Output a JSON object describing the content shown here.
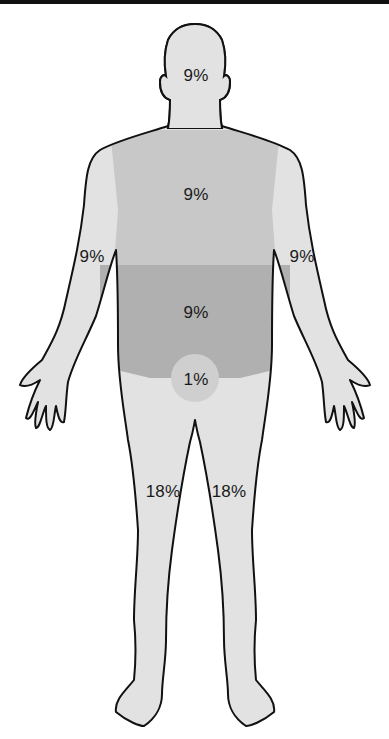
{
  "figure": {
    "colors": {
      "outline": "#111111",
      "light_skin": "#e2e2e2",
      "chest": "#c8c8c8",
      "abdomen": "#b0b0b0",
      "genital": "#cfcfcf",
      "background": "#ffffff"
    },
    "regions": [
      {
        "id": "head",
        "label": "9%"
      },
      {
        "id": "chest",
        "label": "9%"
      },
      {
        "id": "left-arm",
        "label": "9%"
      },
      {
        "id": "right-arm",
        "label": "9%"
      },
      {
        "id": "abdomen",
        "label": "9%"
      },
      {
        "id": "genitals",
        "label": "1%"
      },
      {
        "id": "left-leg",
        "label": "18%"
      },
      {
        "id": "right-leg",
        "label": "18%"
      }
    ]
  }
}
